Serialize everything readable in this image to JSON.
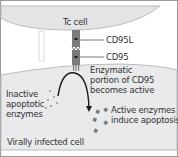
{
  "diagram": {
    "tc_cell_label": "Tc cell",
    "cd95l_label": "CD95L",
    "cd95_label": "CD95",
    "enzymatic_line1": "Enzymatic",
    "enzymatic_line2": "portion of CD95",
    "enzymatic_line3": "becomes active",
    "inactive_line1": "Inactive",
    "inactive_line2": "apoptotic",
    "inactive_line3": "enzymes",
    "active_line1": "Active enzymes",
    "active_line2": "induce apoptosis",
    "infected_cell_label": "Virally infected cell"
  },
  "colors": {
    "cell_fill": "#e2e4e6",
    "cell_edge": "#b9bcbf",
    "receptor": "#7a7a7a",
    "dot": "#8a8a8a",
    "frame": "#9a9a9a"
  }
}
